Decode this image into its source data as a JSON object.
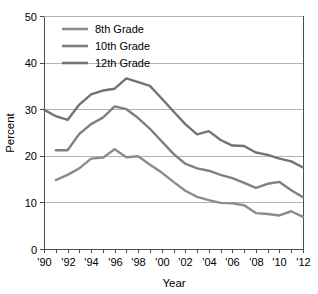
{
  "chart_data": {
    "type": "line",
    "title": "",
    "xlabel": "Year",
    "ylabel": "Percent",
    "xlim": [
      1990,
      2012
    ],
    "ylim": [
      0,
      50
    ],
    "ytick_values": [
      0,
      10,
      20,
      30,
      40,
      50
    ],
    "ytick_labels": [
      "0",
      "10",
      "20",
      "30",
      "40",
      "50"
    ],
    "xtick_values": [
      1990,
      1991,
      1992,
      1993,
      1994,
      1995,
      1996,
      1997,
      1998,
      1999,
      2000,
      2001,
      2002,
      2003,
      2004,
      2005,
      2006,
      2007,
      2008,
      2009,
      2010,
      2011,
      2012
    ],
    "xtick_labels": [
      "'90",
      "",
      "'92",
      "",
      "'94",
      "",
      "'96",
      "",
      "'98",
      "",
      "'00",
      "",
      "'02",
      "",
      "'04",
      "",
      "'06",
      "",
      "'08",
      "",
      "'10",
      "",
      "'12"
    ],
    "grid": "horizontal",
    "legend_position": "top-left-inside",
    "series": [
      {
        "name": "8th Grade",
        "color": "#8c8c8c",
        "x": [
          1991,
          1992,
          1993,
          1994,
          1995,
          1996,
          1997,
          1998,
          1999,
          2000,
          2001,
          2002,
          2003,
          2004,
          2005,
          2006,
          2007,
          2008,
          2009,
          2010,
          2011,
          2012
        ],
        "values": [
          14.8,
          15.9,
          17.3,
          19.4,
          19.6,
          21.4,
          19.7,
          19.9,
          18.1,
          16.4,
          14.4,
          12.5,
          11.2,
          10.5,
          9.9,
          9.8,
          9.4,
          7.7,
          7.5,
          7.2,
          8.1,
          6.9
        ]
      },
      {
        "name": "10th Grade",
        "color": "#808080",
        "x": [
          1991,
          1992,
          1993,
          1994,
          1995,
          1996,
          1997,
          1998,
          1999,
          2000,
          2001,
          2002,
          2003,
          2004,
          2005,
          2006,
          2007,
          2008,
          2009,
          2010,
          2011,
          2012
        ],
        "values": [
          21.2,
          21.2,
          24.7,
          26.8,
          28.2,
          30.6,
          30.0,
          28.1,
          25.8,
          23.1,
          20.4,
          18.3,
          17.3,
          16.8,
          15.9,
          15.2,
          14.2,
          13.1,
          14.0,
          14.4,
          12.6,
          11.1
        ]
      },
      {
        "name": "12th Grade",
        "color": "#737373",
        "x": [
          1990,
          1991,
          1992,
          1993,
          1994,
          1995,
          1996,
          1997,
          1998,
          1999,
          2000,
          2001,
          2002,
          2003,
          2004,
          2005,
          2006,
          2007,
          2008,
          2009,
          2010,
          2011,
          2012
        ],
        "values": [
          29.9,
          28.5,
          27.7,
          31.0,
          33.2,
          34.0,
          34.4,
          36.6,
          35.8,
          35.0,
          32.3,
          29.5,
          26.8,
          24.6,
          25.3,
          23.4,
          22.2,
          22.1,
          20.7,
          20.2,
          19.4,
          18.8,
          17.5
        ]
      }
    ]
  },
  "legend": {
    "entries": [
      {
        "label": "8th Grade"
      },
      {
        "label": "10th Grade"
      },
      {
        "label": "12th Grade"
      }
    ]
  },
  "axes": {
    "y_title": "Percent",
    "x_title": "Year"
  }
}
